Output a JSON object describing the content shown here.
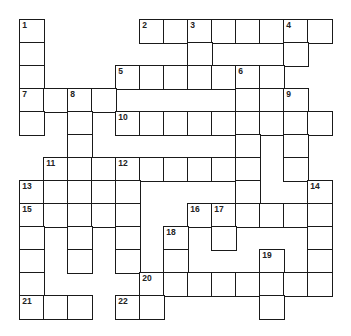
{
  "puzzle": {
    "type": "crossword",
    "rows": 13,
    "cols": 13,
    "colors": {
      "grid_line": "#1a1a1a",
      "cell_fill": "#ffffff",
      "number_text": "#222222"
    },
    "cells": [
      [
        0,
        0,
        "1"
      ],
      [
        0,
        5,
        "2"
      ],
      [
        0,
        6,
        ""
      ],
      [
        0,
        7,
        "3"
      ],
      [
        0,
        8,
        ""
      ],
      [
        0,
        9,
        ""
      ],
      [
        0,
        10,
        ""
      ],
      [
        0,
        11,
        "4"
      ],
      [
        0,
        12,
        ""
      ],
      [
        1,
        0,
        ""
      ],
      [
        1,
        7,
        ""
      ],
      [
        1,
        11,
        ""
      ],
      [
        2,
        0,
        ""
      ],
      [
        2,
        4,
        "5"
      ],
      [
        2,
        5,
        ""
      ],
      [
        2,
        6,
        ""
      ],
      [
        2,
        7,
        ""
      ],
      [
        2,
        8,
        ""
      ],
      [
        2,
        9,
        "6"
      ],
      [
        2,
        10,
        ""
      ],
      [
        3,
        0,
        "7"
      ],
      [
        3,
        1,
        ""
      ],
      [
        3,
        2,
        "8"
      ],
      [
        3,
        3,
        ""
      ],
      [
        3,
        9,
        ""
      ],
      [
        3,
        10,
        ""
      ],
      [
        3,
        11,
        "9"
      ],
      [
        4,
        0,
        ""
      ],
      [
        4,
        2,
        ""
      ],
      [
        4,
        4,
        "10"
      ],
      [
        4,
        5,
        ""
      ],
      [
        4,
        6,
        ""
      ],
      [
        4,
        7,
        ""
      ],
      [
        4,
        8,
        ""
      ],
      [
        4,
        9,
        ""
      ],
      [
        4,
        10,
        ""
      ],
      [
        4,
        11,
        ""
      ],
      [
        4,
        12,
        ""
      ],
      [
        5,
        2,
        ""
      ],
      [
        5,
        9,
        ""
      ],
      [
        5,
        11,
        ""
      ],
      [
        6,
        1,
        "11"
      ],
      [
        6,
        2,
        ""
      ],
      [
        6,
        3,
        ""
      ],
      [
        6,
        4,
        "12"
      ],
      [
        6,
        5,
        ""
      ],
      [
        6,
        6,
        ""
      ],
      [
        6,
        7,
        ""
      ],
      [
        6,
        8,
        ""
      ],
      [
        6,
        9,
        ""
      ],
      [
        6,
        11,
        ""
      ],
      [
        7,
        0,
        "13"
      ],
      [
        7,
        1,
        ""
      ],
      [
        7,
        2,
        ""
      ],
      [
        7,
        3,
        ""
      ],
      [
        7,
        4,
        ""
      ],
      [
        7,
        9,
        ""
      ],
      [
        7,
        12,
        "14"
      ],
      [
        8,
        0,
        "15"
      ],
      [
        8,
        1,
        ""
      ],
      [
        8,
        2,
        ""
      ],
      [
        8,
        3,
        ""
      ],
      [
        8,
        4,
        ""
      ],
      [
        8,
        7,
        "16"
      ],
      [
        8,
        8,
        "17"
      ],
      [
        8,
        9,
        ""
      ],
      [
        8,
        10,
        ""
      ],
      [
        8,
        11,
        ""
      ],
      [
        8,
        12,
        ""
      ],
      [
        9,
        0,
        ""
      ],
      [
        9,
        2,
        ""
      ],
      [
        9,
        4,
        ""
      ],
      [
        9,
        6,
        "18"
      ],
      [
        9,
        8,
        ""
      ],
      [
        9,
        12,
        ""
      ],
      [
        10,
        0,
        ""
      ],
      [
        10,
        2,
        ""
      ],
      [
        10,
        4,
        ""
      ],
      [
        10,
        6,
        ""
      ],
      [
        10,
        10,
        "19"
      ],
      [
        10,
        12,
        ""
      ],
      [
        11,
        0,
        ""
      ],
      [
        11,
        5,
        "20"
      ],
      [
        11,
        6,
        ""
      ],
      [
        11,
        7,
        ""
      ],
      [
        11,
        8,
        ""
      ],
      [
        11,
        9,
        ""
      ],
      [
        11,
        10,
        ""
      ],
      [
        11,
        11,
        ""
      ],
      [
        11,
        12,
        ""
      ],
      [
        12,
        0,
        "21"
      ],
      [
        12,
        1,
        ""
      ],
      [
        12,
        2,
        ""
      ],
      [
        12,
        4,
        "22"
      ],
      [
        12,
        5,
        ""
      ],
      [
        12,
        10,
        ""
      ]
    ],
    "clue_numbers": [
      "1",
      "2",
      "3",
      "4",
      "5",
      "6",
      "7",
      "8",
      "9",
      "10",
      "11",
      "12",
      "13",
      "14",
      "15",
      "16",
      "17",
      "18",
      "19",
      "20",
      "21",
      "22"
    ],
    "entries": {}
  }
}
